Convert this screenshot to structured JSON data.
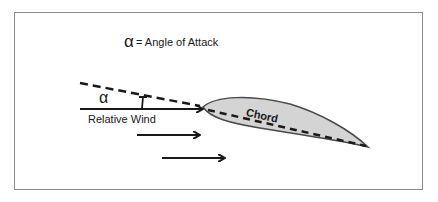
{
  "legend": {
    "symbol": "α",
    "text": "= Angle of Attack"
  },
  "labels": {
    "alpha": "α",
    "relative_wind": "Relative Wind",
    "chord": "Chord"
  },
  "colors": {
    "line": "#1a1a1a",
    "airfoil_fill": "#d4d4d4",
    "airfoil_stroke": "#4a4a4a",
    "frame": "#8c8c8c",
    "background": "#ffffff"
  }
}
